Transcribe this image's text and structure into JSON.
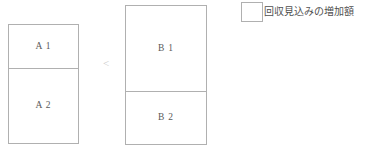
{
  "figure": {
    "type": "stacked-bar-comparison",
    "background_color": "#ffffff",
    "stroke_color": "#b0b0b0",
    "text_color": "#5a5a5a"
  },
  "groups": [
    {
      "name": "group-a",
      "segments": [
        {
          "label": "A 1",
          "height_px": 45
        },
        {
          "label": "A 2",
          "height_px": 76
        }
      ]
    },
    {
      "name": "group-b",
      "segments": [
        {
          "label": "B 1",
          "height_px": 87
        },
        {
          "label": "B 2",
          "height_px": 54
        }
      ]
    }
  ],
  "comparison": {
    "operator": "<"
  },
  "legend": {
    "items": [
      {
        "swatch_icon": "empty-square-swatch",
        "swatch_fill": "#ffffff",
        "swatch_border": "#b0b0b0",
        "label": "回収見込みの増加額"
      }
    ]
  }
}
